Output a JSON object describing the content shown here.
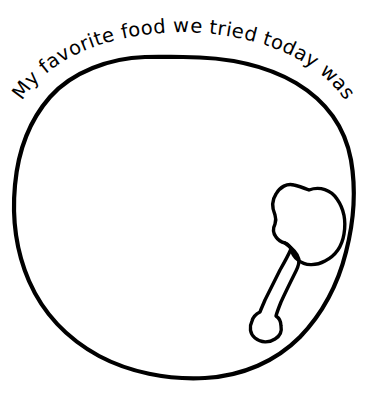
{
  "page": {
    "background_color": "#ffffff",
    "ink_color": "#000000",
    "width": 365,
    "height": 400
  },
  "prompt": {
    "text": "My favorite food we tried today was",
    "style": "curved-along-plate-rim",
    "placement": "top-arc"
  },
  "plate": {
    "label": "hand-drawn dinner plate",
    "shape": "irregular-circle",
    "stroke_color": "#000000",
    "stroke_width": 4.2,
    "fill": "none"
  },
  "spoon": {
    "label": "hand-drawn spoon",
    "stroke_color": "#000000",
    "stroke_width": 3.4,
    "fill": "none",
    "orientation": "bowl-upper-right-handle-lower-left",
    "position": "inside-plate-right-side"
  },
  "drawing_area": {
    "label": "blank drawing space inside plate",
    "hint": ""
  }
}
